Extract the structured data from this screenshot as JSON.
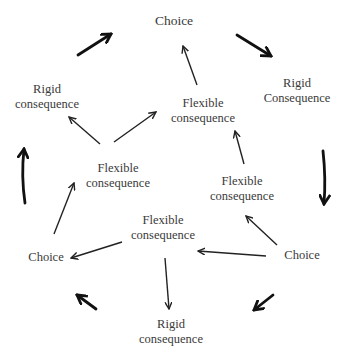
{
  "diagram": {
    "nodes": {
      "choice_top": {
        "label": "Choice"
      },
      "rigid_top_left": {
        "line1": "Rigid",
        "line2": "consequence"
      },
      "rigid_top_right": {
        "line1": "Rigid",
        "line2": "Consequence"
      },
      "flexible_top_center": {
        "line1": "Flexible",
        "line2": "consequence"
      },
      "flexible_middle_left": {
        "line1": "Flexible",
        "line2": "consequence"
      },
      "flexible_middle_right": {
        "line1": "Flexible",
        "line2": "consequence"
      },
      "flexible_bottom_center": {
        "line1": "Flexible",
        "line2": "consequence"
      },
      "choice_left": {
        "label": "Choice"
      },
      "choice_right": {
        "label": "Choice"
      },
      "rigid_bottom": {
        "line1": "Rigid",
        "line2": "consequence"
      }
    },
    "edges_thin": [
      {
        "from": "flexible_top_center",
        "to": "choice_top"
      },
      {
        "from": "flexible_middle_left",
        "to": "rigid_top_left"
      },
      {
        "from": "flexible_middle_left",
        "to": "flexible_top_center"
      },
      {
        "from": "flexible_middle_right",
        "to": "flexible_top_center"
      },
      {
        "from": "choice_left",
        "to": "flexible_middle_left"
      },
      {
        "from": "flexible_bottom_center",
        "to": "choice_left"
      },
      {
        "from": "flexible_bottom_center",
        "to": "rigid_bottom"
      },
      {
        "from": "choice_right",
        "to": "flexible_middle_right"
      },
      {
        "from": "choice_right",
        "to": "flexible_bottom_center"
      }
    ],
    "cycle_arrows_thick": [
      {
        "position": "top-left",
        "direction": "clockwise"
      },
      {
        "position": "top-right",
        "direction": "clockwise"
      },
      {
        "position": "right",
        "direction": "clockwise"
      },
      {
        "position": "bottom-right",
        "direction": "clockwise"
      },
      {
        "position": "bottom-left",
        "direction": "clockwise"
      },
      {
        "position": "left",
        "direction": "clockwise"
      }
    ],
    "colors": {
      "text": "#3a3a3a",
      "arrow": "#111111",
      "background": "#ffffff"
    }
  }
}
